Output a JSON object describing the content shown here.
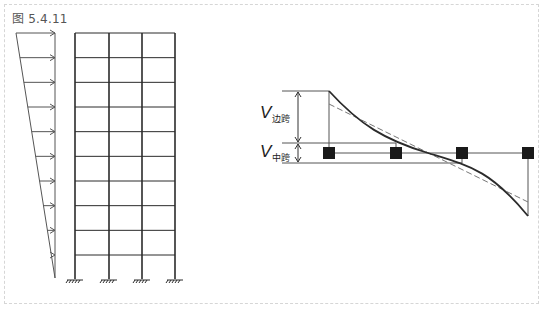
{
  "figure": {
    "title": "图 5.4.11"
  },
  "left_diagram": {
    "description": "9-storey, 3-bay frame with inverted-triangular lateral load distribution",
    "storeys": 9,
    "bays": 3,
    "load_arrows": 10,
    "supports": "fixed"
  },
  "right_diagram": {
    "labels": [
      {
        "symbol": "V",
        "subscript": "边跨"
      },
      {
        "symbol": "V",
        "subscript": "中跨"
      }
    ],
    "curves": [
      {
        "style": "solid",
        "meaning": "actual shear distribution"
      },
      {
        "style": "dashed",
        "meaning": "linear approximation"
      }
    ],
    "nodes": 4
  },
  "colors": {
    "line": "#2b2b2b",
    "thin": "#555555",
    "dashed": "#777777",
    "frame_border": "#d6d6d6"
  }
}
